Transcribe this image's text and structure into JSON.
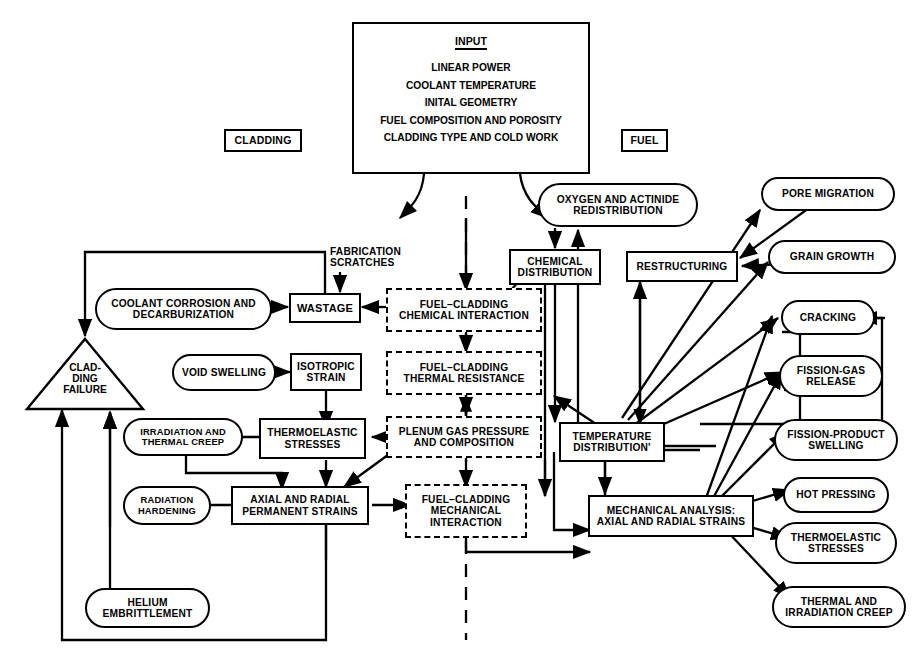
{
  "diagram": {
    "type": "flowchart",
    "ink_color": "#000000",
    "background_color": "#ffffff"
  },
  "input_panel": {
    "title": "INPUT",
    "items": [
      "LINEAR POWER",
      "COOLANT TEMPERATURE",
      "INITAL GEOMETRY",
      "FUEL COMPOSITION AND POROSITY",
      "CLADDING TYPE AND COLD WORK"
    ]
  },
  "section_tags": {
    "left": "CLADDING",
    "right": "FUEL"
  },
  "annotations": {
    "fabrication_scratches": "FABRICATION\nSCRATCHES",
    "fabrication_scratches_line1": "FABRICATION",
    "fabrication_scratches_line2": "SCRATCHES"
  },
  "nodes": {
    "cladding_failure": {
      "label_line1": "CLAD-",
      "label_line2": "DING",
      "label_line3": "FAILURE",
      "shape": "triangle"
    },
    "coolant_corrosion": {
      "label": "COOLANT CORROSION AND\nDECARBURIZATION",
      "l1": "COOLANT CORROSION AND",
      "l2": "DECARBURIZATION",
      "shape": "pill"
    },
    "wastage": {
      "label": "WASTAGE",
      "shape": "rect"
    },
    "void_swelling": {
      "label": "VOID SWELLING",
      "shape": "pill"
    },
    "isotropic_strain": {
      "l1": "ISOTROPIC",
      "l2": "STRAIN",
      "shape": "rect"
    },
    "irradiation_thermal_creep": {
      "l1": "IRRADIATION AND",
      "l2": "THERMAL CREEP",
      "shape": "pill"
    },
    "thermoelastic_stresses_left": {
      "l1": "THERMOELASTIC",
      "l2": "STRESSES",
      "shape": "rect"
    },
    "radiation_hardening": {
      "l1": "RADIATION",
      "l2": "HARDENING",
      "shape": "pill"
    },
    "axial_radial_permanent_strains": {
      "l1": "AXIAL AND RADIAL",
      "l2": "PERMANENT STRAINS",
      "shape": "rect"
    },
    "helium_embrittlement": {
      "l1": "HELIUM",
      "l2": "EMBRITTLEMENT",
      "shape": "pill"
    },
    "fuel_cladding_chemical_interaction": {
      "l1": "FUEL–CLADDING",
      "l2": "CHEMICAL INTERACTION",
      "shape": "dashed-rect"
    },
    "fuel_cladding_thermal_resistance": {
      "l1": "FUEL–CLADDING",
      "l2": "THERMAL RESISTANCE",
      "shape": "dashed-rect"
    },
    "plenum_gas_pressure": {
      "l1": "PLENUM GAS PRESSURE",
      "l2": "AND COMPOSITION",
      "shape": "dashed-rect"
    },
    "fuel_cladding_mechanical_interaction": {
      "l1": "FUEL–CLADDING",
      "l2": "MECHANICAL",
      "l3": "INTERACTION",
      "shape": "dashed-rect"
    },
    "oxygen_actinide_redistribution": {
      "l1": "OXYGEN AND ACTINIDE",
      "l2": "REDISTRIBUTION",
      "shape": "pill"
    },
    "chemical_distribution": {
      "l1": "CHEMICAL",
      "l2": "DISTRIBUTION",
      "shape": "rect"
    },
    "restructuring": {
      "label": "RESTRUCTURING",
      "shape": "rect"
    },
    "temperature_distribution": {
      "l1": "TEMPERATURE",
      "l2": "DISTRIBUTION'",
      "shape": "rect"
    },
    "mechanical_analysis": {
      "l1": "MECHANICAL ANALYSIS:",
      "l2": "AXIAL AND RADIAL STRAINS",
      "shape": "rect"
    },
    "pore_migration": {
      "label": "PORE MIGRATION",
      "shape": "pill"
    },
    "grain_growth": {
      "label": "GRAIN GROWTH",
      "shape": "pill"
    },
    "cracking": {
      "label": "CRACKING",
      "shape": "pill"
    },
    "fission_gas_release": {
      "l1": "FISSION-GAS",
      "l2": "RELEASE",
      "shape": "pill"
    },
    "fission_product_swelling": {
      "l1": "FISSION-PRODUCT",
      "l2": "SWELLING",
      "shape": "pill"
    },
    "hot_pressing": {
      "label": "HOT PRESSING",
      "shape": "pill"
    },
    "thermoelastic_stresses_right": {
      "l1": "THERMOELASTIC",
      "l2": "STRESSES",
      "shape": "pill"
    },
    "thermal_irradiation_creep": {
      "l1": "THERMAL AND",
      "l2": "IRRADIATION CREEP",
      "shape": "pill"
    }
  }
}
